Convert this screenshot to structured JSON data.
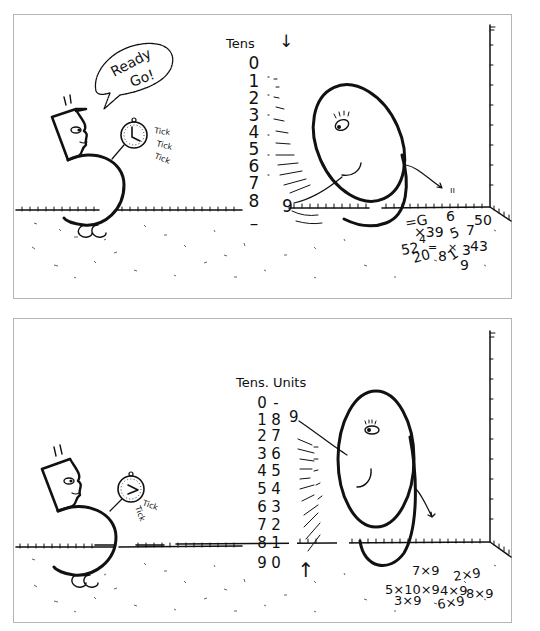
{
  "panels": [
    {
      "name": "tens-counting",
      "speech_bubble": [
        "Ready",
        "Go!"
      ],
      "tick_labels": [
        "Tick",
        "Tick",
        "Tick"
      ],
      "column_header": "Tens",
      "tens_digits": [
        "0",
        "1",
        "2",
        "3",
        "4",
        "5",
        "6",
        "7",
        "8",
        "–"
      ],
      "arrow": "↓",
      "small_nine": "9",
      "scattered_math": [
        "=G",
        "×39",
        "6",
        "5",
        "7",
        "50",
        "52",
        "4",
        "=",
        "20",
        "8",
        "×",
        "1",
        "3",
        "43",
        "9"
      ],
      "finger_label": "ıı"
    },
    {
      "name": "tens-units-table",
      "tick_labels": [
        "Tick",
        "Tick"
      ],
      "column_header": "Tens. Units",
      "rows": [
        {
          "tens": "0",
          "units": "-"
        },
        {
          "tens": "1",
          "units": "8"
        },
        {
          "tens": "2",
          "units": "7"
        },
        {
          "tens": "3",
          "units": "6"
        },
        {
          "tens": "4",
          "units": "5"
        },
        {
          "tens": "5",
          "units": "4"
        },
        {
          "tens": "6",
          "units": "3"
        },
        {
          "tens": "7",
          "units": "2"
        },
        {
          "tens": "8",
          "units": "1"
        },
        {
          "tens": "9",
          "units": "0"
        }
      ],
      "arrow": "↑",
      "small_nine": "9",
      "scattered_math": [
        "7×9",
        "2×9",
        "5×10×9",
        "4×9",
        "8×9",
        "3×9",
        "6×9"
      ]
    }
  ]
}
